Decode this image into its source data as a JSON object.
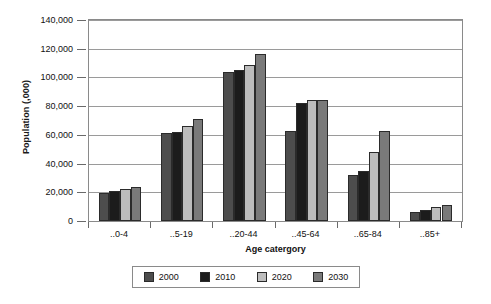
{
  "chart_data": {
    "type": "bar",
    "title": "",
    "xlabel": "Age catergory",
    "ylabel": "Population (,000)",
    "categories": [
      "..0-4",
      "..5-19",
      "..20-44",
      "..45-64",
      "..65-84",
      "..85+"
    ],
    "series": [
      {
        "name": "2000",
        "color": "#4d4d4d",
        "values": [
          19500,
          61000,
          104000,
          63000,
          32000,
          6000
        ]
      },
      {
        "name": "2010",
        "color": "#1c1c1c",
        "values": [
          21000,
          62000,
          105000,
          82000,
          35000,
          8000
        ]
      },
      {
        "name": "2020",
        "color": "#bdbdbd",
        "values": [
          22500,
          66000,
          109000,
          84000,
          48000,
          9500
        ]
      },
      {
        "name": "2030",
        "color": "#7a7a7a",
        "values": [
          24000,
          71000,
          116000,
          84000,
          63000,
          11000
        ]
      }
    ],
    "ylim": [
      0,
      140000
    ],
    "ytick_values": [
      0,
      20000,
      40000,
      60000,
      80000,
      100000,
      120000,
      140000
    ],
    "ytick_labels": [
      "0",
      "20,000",
      "40,000",
      "60,000",
      "80,000",
      "100,000",
      "120,000",
      "140,000"
    ],
    "grid": true,
    "legend_position": "bottom"
  },
  "legend": {
    "entries": [
      {
        "label": "2000",
        "color": "#4d4d4d"
      },
      {
        "label": "2010",
        "color": "#1c1c1c"
      },
      {
        "label": "2020",
        "color": "#bdbdbd"
      },
      {
        "label": "2030",
        "color": "#7a7a7a"
      }
    ]
  }
}
